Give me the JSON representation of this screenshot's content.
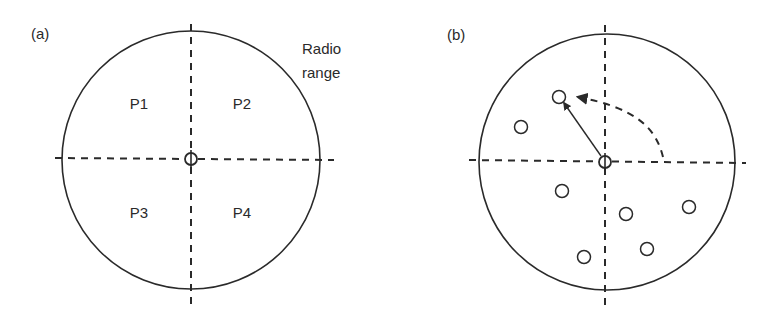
{
  "figure": {
    "colors": {
      "stroke": "#2a2a2a",
      "background": "#ffffff"
    },
    "panel_a": {
      "tag": "(a)",
      "radio_range_label_line1": "Radio",
      "radio_range_label_line2": "range",
      "quadrants": [
        {
          "label": "P1",
          "position": "top-left"
        },
        {
          "label": "P2",
          "position": "top-right"
        },
        {
          "label": "P3",
          "position": "bottom-left"
        },
        {
          "label": "P4",
          "position": "bottom-right"
        }
      ],
      "center_node": "origin node (hollow circle at crosshair)"
    },
    "panel_b": {
      "tag": "(b)",
      "neighbor_node_count": 7,
      "description": "Center node with solid arrow to selected neighbor in P1 quadrant; dashed curved arrow indicating counter-clockwise rotation from +x axis"
    }
  }
}
